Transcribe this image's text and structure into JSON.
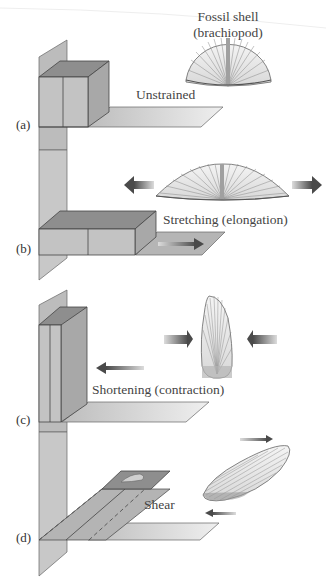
{
  "diagram": {
    "type": "strain-deformation-illustration",
    "header_fragment": "",
    "fossil_label_line1": "Fossil shell",
    "fossil_label_line2": "(brachiopod)",
    "panels": [
      {
        "id": "a",
        "label": "(a)",
        "caption": "Unstrained"
      },
      {
        "id": "b",
        "label": "(b)",
        "caption": "Stretching (elongation)"
      },
      {
        "id": "c",
        "label": "(c)",
        "caption": "Shortening (contraction)"
      },
      {
        "id": "d",
        "label": "(d)",
        "caption": "Shear"
      }
    ],
    "colors": {
      "plane_gray": "#b9b9b9",
      "plane_light": "#e2e2e2",
      "block_top": "#8f8f8f",
      "block_front": "#c4c4c4",
      "block_side": "#a9a9a9",
      "outline": "#555555",
      "arrow_dark": "#5a5a5a",
      "shell_fill": "#ececec",
      "shell_lines": "#7a7a7a"
    }
  }
}
